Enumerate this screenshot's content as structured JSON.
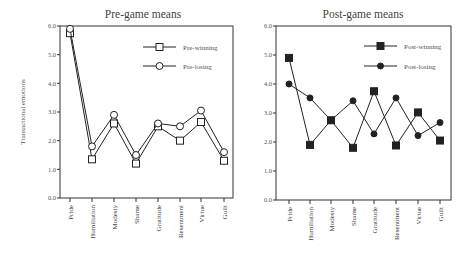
{
  "figure": {
    "ylabel": "Transactional emotions"
  },
  "chart_data": [
    {
      "type": "line",
      "title": "Pre-game means",
      "xlabel": "",
      "ylabel": "Transactional emotions",
      "ylim": [
        0,
        6
      ],
      "yticks": [
        "0.0",
        "1.0",
        "2.0",
        "3.0",
        "4.0",
        "5.0",
        "6.0"
      ],
      "grid": false,
      "legend_position": "upper right",
      "categories": [
        "Pride",
        "Humiliation",
        "Modesty",
        "Shame",
        "Gratitude",
        "Resentment",
        "Virtue",
        "Guilt"
      ],
      "series": [
        {
          "name": "Pre-winning",
          "marker": "open-square",
          "values": [
            5.75,
            1.35,
            2.6,
            1.2,
            2.5,
            2.0,
            2.65,
            1.3
          ]
        },
        {
          "name": "Pre-losing",
          "marker": "open-circle",
          "values": [
            5.9,
            1.8,
            2.9,
            1.5,
            2.6,
            2.5,
            3.05,
            1.6
          ]
        }
      ]
    },
    {
      "type": "line",
      "title": "Post-game means",
      "xlabel": "",
      "ylabel": "",
      "ylim": [
        0,
        6
      ],
      "yticks": [
        "0.0",
        "1.0",
        "2.0",
        "3.0",
        "4.0",
        "5.0",
        "6.0"
      ],
      "grid": false,
      "legend_position": "upper right",
      "categories": [
        "Pride",
        "Humiliation",
        "Modesty",
        "Shame",
        "Gratitude",
        "Resentment",
        "Virtue",
        "Guilt"
      ],
      "series": [
        {
          "name": "Post-winning",
          "marker": "filled-square",
          "values": [
            4.9,
            1.9,
            2.75,
            1.8,
            3.75,
            1.88,
            3.02,
            2.05
          ]
        },
        {
          "name": "Post-losing",
          "marker": "filled-circle",
          "values": [
            4.0,
            3.52,
            2.75,
            3.42,
            2.28,
            3.52,
            2.22,
            2.67
          ]
        }
      ]
    }
  ]
}
